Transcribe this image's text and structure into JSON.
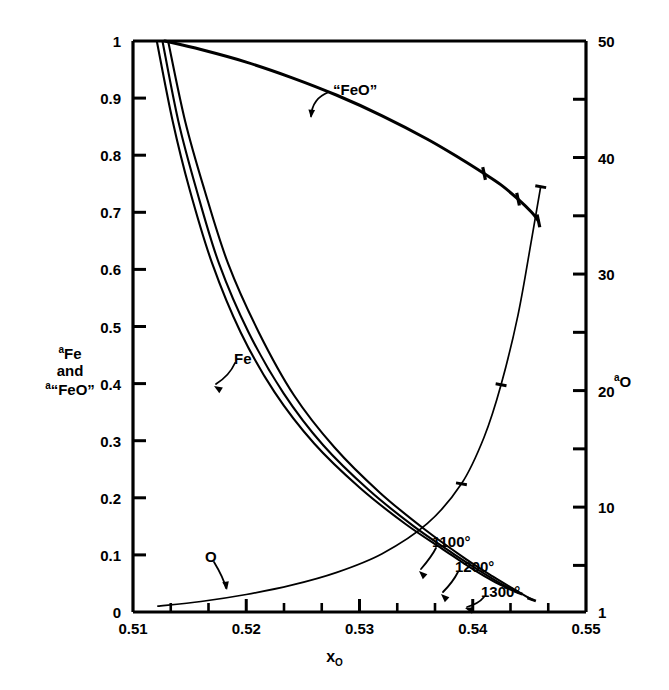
{
  "chart_data": {
    "type": "line",
    "title": "",
    "xlabel": "x_O",
    "xlabel_parts": {
      "base": "x",
      "sub": "O"
    },
    "ylabel_left_parts": [
      {
        "sup": "a",
        "base": "Fe"
      },
      {
        "sup": "",
        "base": "and"
      },
      {
        "sup": "a",
        "base": "“FeO”"
      }
    ],
    "ylabel_right_parts": {
      "sup": "a",
      "base": "O"
    },
    "xlim": [
      0.51,
      0.55
    ],
    "ylim_left": [
      0,
      1
    ],
    "ylim_right": [
      1,
      50
    ],
    "grid": false,
    "legend": "none (curves labeled inline)",
    "x_ticks": [
      "0.51",
      "0.52",
      "0.53",
      "0.54",
      "0.55"
    ],
    "x_tick_values": [
      0.51,
      0.52,
      0.53,
      0.54,
      0.55
    ],
    "x_minor_count_per_major": 2,
    "y_left_ticks": [
      "0",
      "0.1",
      "0.2",
      "0.3",
      "0.4",
      "0.5",
      "0.6",
      "0.7",
      "0.8",
      "0.9",
      "1"
    ],
    "y_left_tick_values": [
      0,
      0.1,
      0.2,
      0.3,
      0.4,
      0.5,
      0.6,
      0.7,
      0.8,
      0.9,
      1
    ],
    "y_right_ticks": [
      "1",
      "10",
      "20",
      "30",
      "40",
      "50"
    ],
    "y_right_tick_values": [
      1,
      10,
      20,
      30,
      40,
      50
    ],
    "y_right_minor_values": [
      5,
      15,
      25,
      35,
      45
    ],
    "annotations": [
      {
        "text": "“FeO”",
        "x_px": 333,
        "y_px": 82,
        "leader": "curved-left-down"
      },
      {
        "text": "Fe",
        "x_px": 234,
        "y_px": 351,
        "leader": "curved-left-down"
      },
      {
        "text": "O",
        "x_px": 205,
        "y_px": 549,
        "leader": "curved-right-down"
      },
      {
        "text": "1100°",
        "x_px": 432,
        "y_px": 534,
        "leader": "arrow-down-left"
      },
      {
        "text": "1200°",
        "x_px": 455,
        "y_px": 559,
        "leader": "arrow-down-left"
      },
      {
        "text": "1300°",
        "x_px": 481,
        "y_px": 584,
        "leader": "arrow-down-left"
      }
    ],
    "series": [
      {
        "name": "a_Fe at 1100°",
        "axis": "left",
        "points": [
          [
            0.5121,
            1.0
          ],
          [
            0.5135,
            0.86
          ],
          [
            0.515,
            0.74
          ],
          [
            0.517,
            0.61
          ],
          [
            0.5195,
            0.49
          ],
          [
            0.5225,
            0.385
          ],
          [
            0.526,
            0.295
          ],
          [
            0.53,
            0.218
          ],
          [
            0.534,
            0.155
          ],
          [
            0.5375,
            0.108
          ],
          [
            0.54,
            0.075
          ],
          [
            0.542,
            0.052
          ],
          [
            0.5432,
            0.041
          ]
        ]
      },
      {
        "name": "a_Fe at 1200°",
        "axis": "left",
        "points": [
          [
            0.5126,
            1.0
          ],
          [
            0.514,
            0.86
          ],
          [
            0.5156,
            0.74
          ],
          [
            0.5176,
            0.61
          ],
          [
            0.5202,
            0.49
          ],
          [
            0.5233,
            0.383
          ],
          [
            0.5268,
            0.292
          ],
          [
            0.5308,
            0.214
          ],
          [
            0.5348,
            0.15
          ],
          [
            0.5383,
            0.102
          ],
          [
            0.5408,
            0.07
          ],
          [
            0.5428,
            0.046
          ],
          [
            0.544,
            0.034
          ]
        ]
      },
      {
        "name": "a_Fe at 1300°",
        "axis": "left",
        "points": [
          [
            0.5131,
            1.0
          ],
          [
            0.5146,
            0.86
          ],
          [
            0.5163,
            0.74
          ],
          [
            0.5184,
            0.61
          ],
          [
            0.5211,
            0.49
          ],
          [
            0.5242,
            0.38
          ],
          [
            0.5278,
            0.288
          ],
          [
            0.5318,
            0.209
          ],
          [
            0.5358,
            0.144
          ],
          [
            0.5393,
            0.094
          ],
          [
            0.5418,
            0.062
          ],
          [
            0.5438,
            0.038
          ],
          [
            0.5452,
            0.022
          ]
        ]
      },
      {
        "name": "a_“FeO”",
        "axis": "left",
        "points": [
          [
            0.5128,
            1.0
          ],
          [
            0.516,
            0.985
          ],
          [
            0.52,
            0.963
          ],
          [
            0.524,
            0.936
          ],
          [
            0.528,
            0.905
          ],
          [
            0.532,
            0.869
          ],
          [
            0.536,
            0.828
          ],
          [
            0.539,
            0.793
          ],
          [
            0.541,
            0.768
          ],
          [
            0.5425,
            0.748
          ],
          [
            0.544,
            0.723
          ],
          [
            0.5452,
            0.7
          ],
          [
            0.5458,
            0.685
          ]
        ]
      },
      {
        "name": "a_O",
        "axis": "right",
        "points": [
          [
            0.5122,
            1.5
          ],
          [
            0.516,
            1.9
          ],
          [
            0.52,
            2.5
          ],
          [
            0.524,
            3.3
          ],
          [
            0.528,
            4.4
          ],
          [
            0.532,
            6.0
          ],
          [
            0.536,
            8.6
          ],
          [
            0.539,
            12.0
          ],
          [
            0.541,
            16.0
          ],
          [
            0.5425,
            20.5
          ],
          [
            0.544,
            26.5
          ],
          [
            0.5452,
            33.0
          ],
          [
            0.546,
            37.5
          ]
        ]
      }
    ]
  }
}
